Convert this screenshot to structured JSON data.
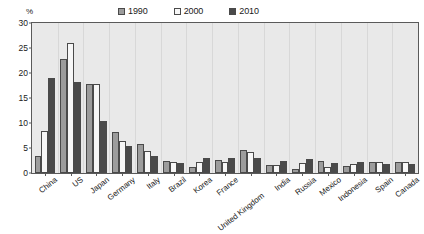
{
  "chart_data": {
    "type": "bar",
    "title": "",
    "subtitle": "",
    "xlabel": "",
    "ylabel": "%",
    "ylim": [
      0,
      30
    ],
    "ytick_values": [
      0,
      5,
      10,
      15,
      20,
      25,
      30
    ],
    "ytick_labels": [
      "0",
      "5",
      "10",
      "15",
      "20",
      "25",
      "30"
    ],
    "grid": "vertical-category-separators",
    "legend_position": "top-right",
    "categories": [
      "China",
      "US",
      "Japan",
      "Germany",
      "Italy",
      "Brazil",
      "Korea",
      "France",
      "United Kingdom",
      "India",
      "Russia",
      "Mexico",
      "Indonesia",
      "Spain",
      "Canada"
    ],
    "series": [
      {
        "name": "1990",
        "color": "#9c9c9c",
        "values": [
          3.5,
          22.9,
          17.8,
          8.3,
          5.8,
          2.5,
          1.3,
          2.6,
          4.7,
          1.6,
          0.9,
          2.4,
          1.4,
          2.2,
          2.3
        ]
      },
      {
        "name": "2000",
        "color": "#f7f7f7",
        "values": [
          8.5,
          26.0,
          17.8,
          6.5,
          4.5,
          2.2,
          2.2,
          2.2,
          4.2,
          1.6,
          2.0,
          1.3,
          1.9,
          2.2,
          2.3
        ]
      },
      {
        "name": "2010",
        "color": "#4a4a4a",
        "values": [
          19.0,
          18.3,
          10.5,
          5.5,
          3.5,
          2.0,
          3.0,
          3.0,
          3.0,
          2.5,
          2.8,
          2.0,
          2.3,
          1.9,
          1.9
        ]
      }
    ]
  },
  "legend": {
    "items": [
      {
        "label": "1990",
        "color": "#9c9c9c"
      },
      {
        "label": "2000",
        "color": "#f7f7f7"
      },
      {
        "label": "2010",
        "color": "#4a4a4a"
      }
    ]
  },
  "axes": {
    "y_unit": "%"
  }
}
